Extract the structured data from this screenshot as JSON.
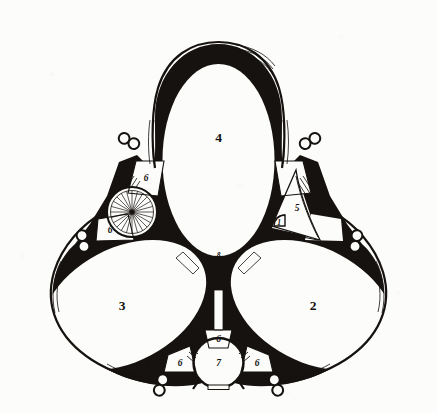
{
  "plate": {
    "title": "Trefoil ground plan",
    "background_color": "#fcfcfb",
    "ink_color": "#15120f"
  },
  "labels": {
    "hall_top": "4",
    "hall_left": "3",
    "hall_right": "2",
    "center_junction": "8",
    "round_room": "7",
    "triangular_space": "5",
    "quarter_round": "1",
    "niche_upper_left": "6",
    "niche_lower_left": "6",
    "niche_bottom_center": "6",
    "niche_bottom_left": "6",
    "niche_bottom_right": "6"
  },
  "features": {
    "spiral_stair_spokes": 24,
    "column_pair_clusters": 6,
    "columns_per_cluster": 2,
    "oval_halls": 3,
    "hatched_wall_bands": 12
  }
}
